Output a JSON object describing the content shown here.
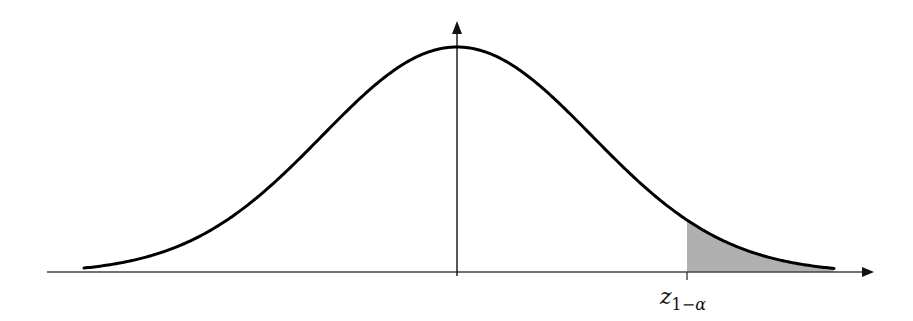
{
  "diagram": {
    "title": "",
    "curve": {
      "type": "normal-density",
      "center_x": 457,
      "sigma_px": 135,
      "baseline_y": 273,
      "peak_y": 47,
      "x_start": 84,
      "x_end": 834,
      "stroke": "#000000"
    },
    "axes": {
      "x_axis": {
        "x_start": 47,
        "x_end": 873,
        "y": 272,
        "color": "#444444",
        "arrow": true
      },
      "y_axis": {
        "x": 457,
        "y_start": 275,
        "y_end": 22,
        "color": "#111111",
        "arrow": true
      }
    },
    "shaded_region": {
      "from_x": 687,
      "to_x": 834,
      "fill": "#b0b0b0"
    },
    "tick": {
      "x": 687,
      "label_main": "z",
      "label_sub_num": "1−",
      "label_sub_alpha": "α"
    }
  }
}
